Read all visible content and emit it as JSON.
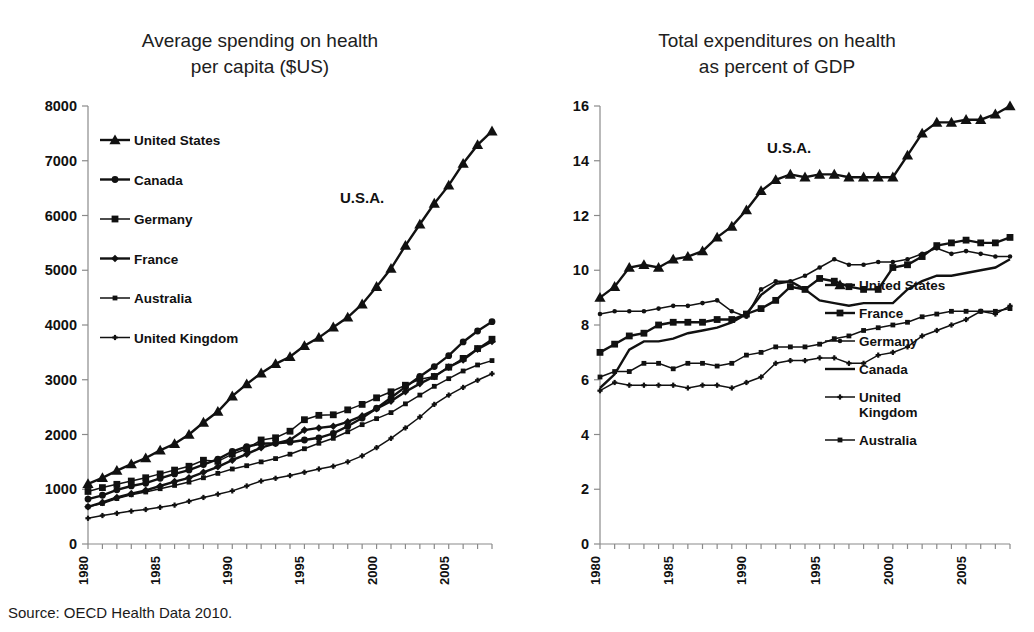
{
  "source_note": "Source: OECD Health Data 2010.",
  "annotations": {
    "usa_left": "U.S.A.",
    "usa_right": "U.S.A."
  },
  "chart_data": [
    {
      "id": "spending-per-capita",
      "type": "line",
      "title": "Average spending on health\nper capita ($US)",
      "xlabel": "",
      "ylabel": "",
      "xlim": [
        1980,
        2008
      ],
      "ylim": [
        0,
        8000
      ],
      "ytick_labels": [
        "0",
        "1000",
        "2000",
        "3000",
        "4000",
        "5000",
        "6000",
        "7000",
        "8000"
      ],
      "yticks": [
        0,
        1000,
        2000,
        3000,
        4000,
        5000,
        6000,
        7000,
        8000
      ],
      "xticks": [
        1980,
        1985,
        1990,
        1995,
        2000,
        2005
      ],
      "xtick_labels": [
        "1980",
        "1985",
        "1990",
        "1995",
        "2000",
        "2005"
      ],
      "x": [
        1980,
        1981,
        1982,
        1983,
        1984,
        1985,
        1986,
        1987,
        1988,
        1989,
        1990,
        1991,
        1992,
        1993,
        1994,
        1995,
        1996,
        1997,
        1998,
        1999,
        2000,
        2001,
        2002,
        2003,
        2004,
        2005,
        2006,
        2007,
        2008
      ],
      "grid": false,
      "legend_position": "upper-left-inside",
      "annotation": "U.S.A.",
      "series": [
        {
          "name": "United States",
          "marker": "triangle",
          "values": [
            1100,
            1210,
            1340,
            1460,
            1570,
            1710,
            1830,
            2000,
            2220,
            2420,
            2700,
            2920,
            3120,
            3290,
            3420,
            3620,
            3770,
            3960,
            4140,
            4380,
            4700,
            5030,
            5450,
            5840,
            6220,
            6550,
            6950,
            7290,
            7540
          ]
        },
        {
          "name": "Canada",
          "marker": "circle",
          "values": [
            820,
            890,
            990,
            1060,
            1110,
            1200,
            1280,
            1350,
            1450,
            1550,
            1690,
            1780,
            1830,
            1840,
            1860,
            1900,
            1940,
            2020,
            2150,
            2300,
            2480,
            2670,
            2870,
            3060,
            3240,
            3440,
            3690,
            3890,
            4060
          ]
        },
        {
          "name": "Germany",
          "marker": "square",
          "values": [
            960,
            1030,
            1090,
            1150,
            1210,
            1280,
            1350,
            1420,
            1530,
            1510,
            1640,
            1740,
            1900,
            1940,
            2060,
            2270,
            2350,
            2360,
            2450,
            2550,
            2670,
            2780,
            2900,
            3010,
            3060,
            3230,
            3390,
            3570,
            3740
          ]
        },
        {
          "name": "France",
          "marker": "diamond",
          "values": [
            680,
            760,
            850,
            920,
            980,
            1060,
            1140,
            1210,
            1310,
            1410,
            1530,
            1640,
            1760,
            1840,
            1900,
            2080,
            2120,
            2150,
            2230,
            2340,
            2470,
            2610,
            2780,
            2930,
            3060,
            3230,
            3360,
            3560,
            3700
          ]
        },
        {
          "name": "Australia",
          "marker": "square-small",
          "values": [
            680,
            740,
            830,
            900,
            950,
            1010,
            1070,
            1130,
            1210,
            1290,
            1370,
            1430,
            1500,
            1560,
            1640,
            1740,
            1840,
            1930,
            2050,
            2180,
            2290,
            2400,
            2560,
            2720,
            2880,
            3020,
            3160,
            3270,
            3350
          ]
        },
        {
          "name": "United Kingdom",
          "marker": "plus-small",
          "values": [
            470,
            520,
            560,
            600,
            630,
            670,
            710,
            780,
            850,
            910,
            970,
            1060,
            1150,
            1200,
            1250,
            1310,
            1370,
            1420,
            1500,
            1610,
            1760,
            1930,
            2120,
            2320,
            2550,
            2720,
            2860,
            2990,
            3110
          ]
        }
      ]
    },
    {
      "id": "health-percent-gdp",
      "type": "line",
      "title": "Total expenditures on health\nas percent of GDP",
      "xlabel": "",
      "ylabel": "",
      "xlim": [
        1980,
        2008
      ],
      "ylim": [
        0,
        16
      ],
      "ytick_labels": [
        "0",
        "2",
        "4",
        "6",
        "8",
        "10",
        "12",
        "14",
        "16"
      ],
      "yticks": [
        0,
        2,
        4,
        6,
        8,
        10,
        12,
        14,
        16
      ],
      "xticks": [
        1980,
        1985,
        1990,
        1995,
        2000,
        2005
      ],
      "xtick_labels": [
        "1980",
        "1985",
        "1990",
        "1995",
        "2000",
        "2005"
      ],
      "x": [
        1980,
        1981,
        1982,
        1983,
        1984,
        1985,
        1986,
        1987,
        1988,
        1989,
        1990,
        1991,
        1992,
        1993,
        1994,
        1995,
        1996,
        1997,
        1998,
        1999,
        2000,
        2001,
        2002,
        2003,
        2004,
        2005,
        2006,
        2007,
        2008
      ],
      "grid": false,
      "legend_position": "lower-right-inside",
      "annotation": "U.S.A.",
      "series": [
        {
          "name": "United States",
          "marker": "triangle",
          "values": [
            9.0,
            9.4,
            10.1,
            10.2,
            10.1,
            10.4,
            10.5,
            10.7,
            11.2,
            11.6,
            12.2,
            12.9,
            13.3,
            13.5,
            13.4,
            13.5,
            13.5,
            13.4,
            13.4,
            13.4,
            13.4,
            14.2,
            15.0,
            15.4,
            15.4,
            15.5,
            15.5,
            15.7,
            16.0
          ]
        },
        {
          "name": "France",
          "marker": "square",
          "values": [
            7.0,
            7.3,
            7.6,
            7.7,
            8.0,
            8.1,
            8.1,
            8.1,
            8.2,
            8.2,
            8.4,
            8.6,
            8.9,
            9.4,
            9.3,
            9.7,
            9.6,
            9.4,
            9.3,
            9.3,
            10.1,
            10.2,
            10.5,
            10.9,
            11.0,
            11.1,
            11.0,
            11.0,
            11.2
          ]
        },
        {
          "name": "Germany",
          "marker": "circle-small",
          "values": [
            8.4,
            8.5,
            8.5,
            8.5,
            8.6,
            8.7,
            8.7,
            8.8,
            8.9,
            8.5,
            8.3,
            9.3,
            9.6,
            9.6,
            9.8,
            10.1,
            10.4,
            10.2,
            10.2,
            10.3,
            10.3,
            10.4,
            10.6,
            10.8,
            10.6,
            10.7,
            10.6,
            10.5,
            10.5
          ]
        },
        {
          "name": "Canada",
          "marker": "none",
          "values": [
            5.7,
            6.2,
            7.1,
            7.4,
            7.4,
            7.5,
            7.7,
            7.8,
            7.9,
            8.1,
            8.4,
            9.1,
            9.5,
            9.6,
            9.3,
            8.9,
            8.8,
            8.7,
            8.8,
            8.8,
            8.8,
            9.3,
            9.6,
            9.8,
            9.8,
            9.9,
            10.0,
            10.1,
            10.4
          ]
        },
        {
          "name": "United Kingdom",
          "marker": "plus-small",
          "values": [
            5.6,
            5.9,
            5.8,
            5.8,
            5.8,
            5.8,
            5.7,
            5.8,
            5.8,
            5.7,
            5.9,
            6.1,
            6.6,
            6.7,
            6.7,
            6.8,
            6.8,
            6.6,
            6.6,
            6.9,
            7.0,
            7.2,
            7.6,
            7.8,
            8.0,
            8.2,
            8.5,
            8.4,
            8.7
          ]
        },
        {
          "name": "Australia",
          "marker": "square-small",
          "values": [
            6.1,
            6.3,
            6.3,
            6.6,
            6.6,
            6.4,
            6.6,
            6.6,
            6.5,
            6.6,
            6.9,
            7.0,
            7.2,
            7.2,
            7.2,
            7.3,
            7.5,
            7.6,
            7.8,
            7.9,
            8.0,
            8.1,
            8.3,
            8.4,
            8.5,
            8.5,
            8.5,
            8.5,
            8.6
          ]
        }
      ]
    }
  ]
}
